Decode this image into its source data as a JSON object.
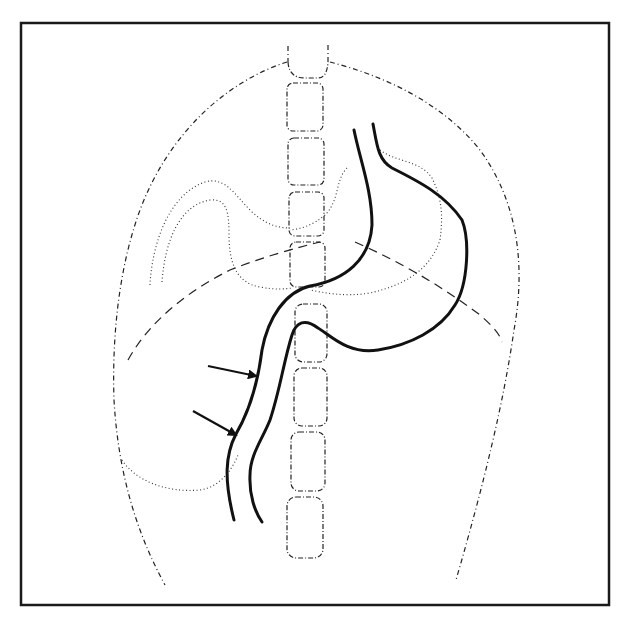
{
  "diagram": {
    "title": "",
    "colors": {
      "background": "#ffffff",
      "ink": "#111111",
      "frame": "#1a1a1a"
    },
    "frame": {
      "x": 21,
      "y": 22,
      "width": 588,
      "height": 583
    },
    "arrows": [
      {
        "id": "arrow-upper",
        "from": [
          208,
          366
        ],
        "to": [
          258,
          376
        ]
      },
      {
        "id": "arrow-lower",
        "from": [
          193,
          411
        ],
        "to": [
          238,
          436
        ]
      }
    ],
    "vertebrae": [
      {
        "x": 290,
        "y": 55,
        "w": 35,
        "h": 50
      },
      {
        "x": 289,
        "y": 110,
        "w": 36,
        "h": 48
      },
      {
        "x": 290,
        "y": 162,
        "w": 35,
        "h": 45
      },
      {
        "x": 290,
        "y": 210,
        "w": 35,
        "h": 42
      },
      {
        "x": 291,
        "y": 247,
        "w": 35,
        "h": 43
      },
      {
        "x": 295,
        "y": 304,
        "w": 32,
        "h": 58
      },
      {
        "x": 294,
        "y": 368,
        "w": 33,
        "h": 58
      },
      {
        "x": 291,
        "y": 431,
        "w": 34,
        "h": 59
      },
      {
        "x": 288,
        "y": 496,
        "w": 35,
        "h": 62
      }
    ],
    "labels": []
  }
}
